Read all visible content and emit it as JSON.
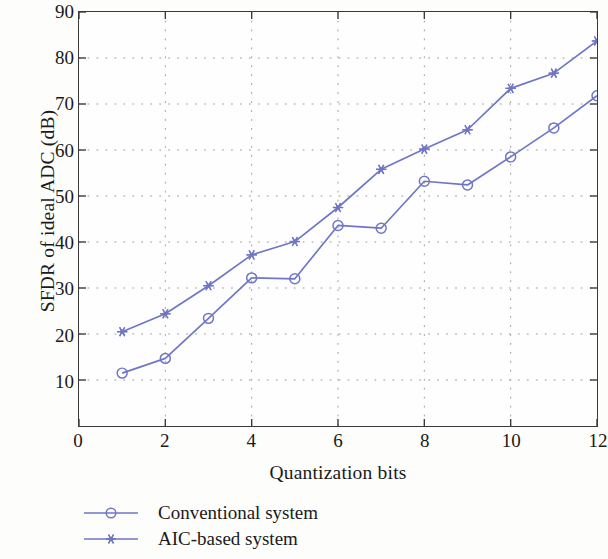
{
  "chart_data": {
    "type": "line",
    "title": "",
    "xlabel": "Quantization bits",
    "ylabel": "SFDR of ideal ADC (dB)",
    "xlim": [
      0,
      12
    ],
    "ylim": [
      0,
      90
    ],
    "xticks": [
      0,
      2,
      4,
      6,
      8,
      10,
      12
    ],
    "yticks": [
      10,
      20,
      30,
      40,
      50,
      60,
      70,
      80,
      90
    ],
    "grid": "dotted",
    "legend_position": "below-plot-left",
    "x": [
      1,
      2,
      3,
      4,
      5,
      6,
      7,
      8,
      9,
      10,
      11,
      12
    ],
    "series": [
      {
        "name": "Conventional system",
        "marker": "open-circle",
        "color": "#6f76c6",
        "values": [
          11.5,
          14.7,
          23.4,
          32.2,
          32.0,
          43.6,
          43.0,
          53.2,
          52.4,
          58.5,
          64.8,
          71.8
        ]
      },
      {
        "name": "AIC-based system",
        "marker": "star",
        "color": "#6f76c6",
        "values": [
          20.5,
          24.4,
          30.5,
          37.2,
          40.1,
          47.5,
          55.8,
          60.2,
          64.4,
          73.4,
          76.7,
          83.7
        ]
      }
    ]
  },
  "axis": {
    "y_tick_labels": [
      "90",
      "80",
      "70",
      "60",
      "50",
      "40",
      "30",
      "20",
      "10"
    ],
    "x_tick_labels": [
      "0",
      "2",
      "4",
      "6",
      "8",
      "10",
      "12"
    ],
    "y_title": "SFDR of ideal ADC (dB)",
    "x_title": "Quantization bits"
  },
  "legend": {
    "items": [
      {
        "label": "Conventional system",
        "marker": "open-circle",
        "color": "#6f76c6"
      },
      {
        "label": "AIC-based system",
        "marker": "star",
        "color": "#6f76c6"
      }
    ]
  }
}
